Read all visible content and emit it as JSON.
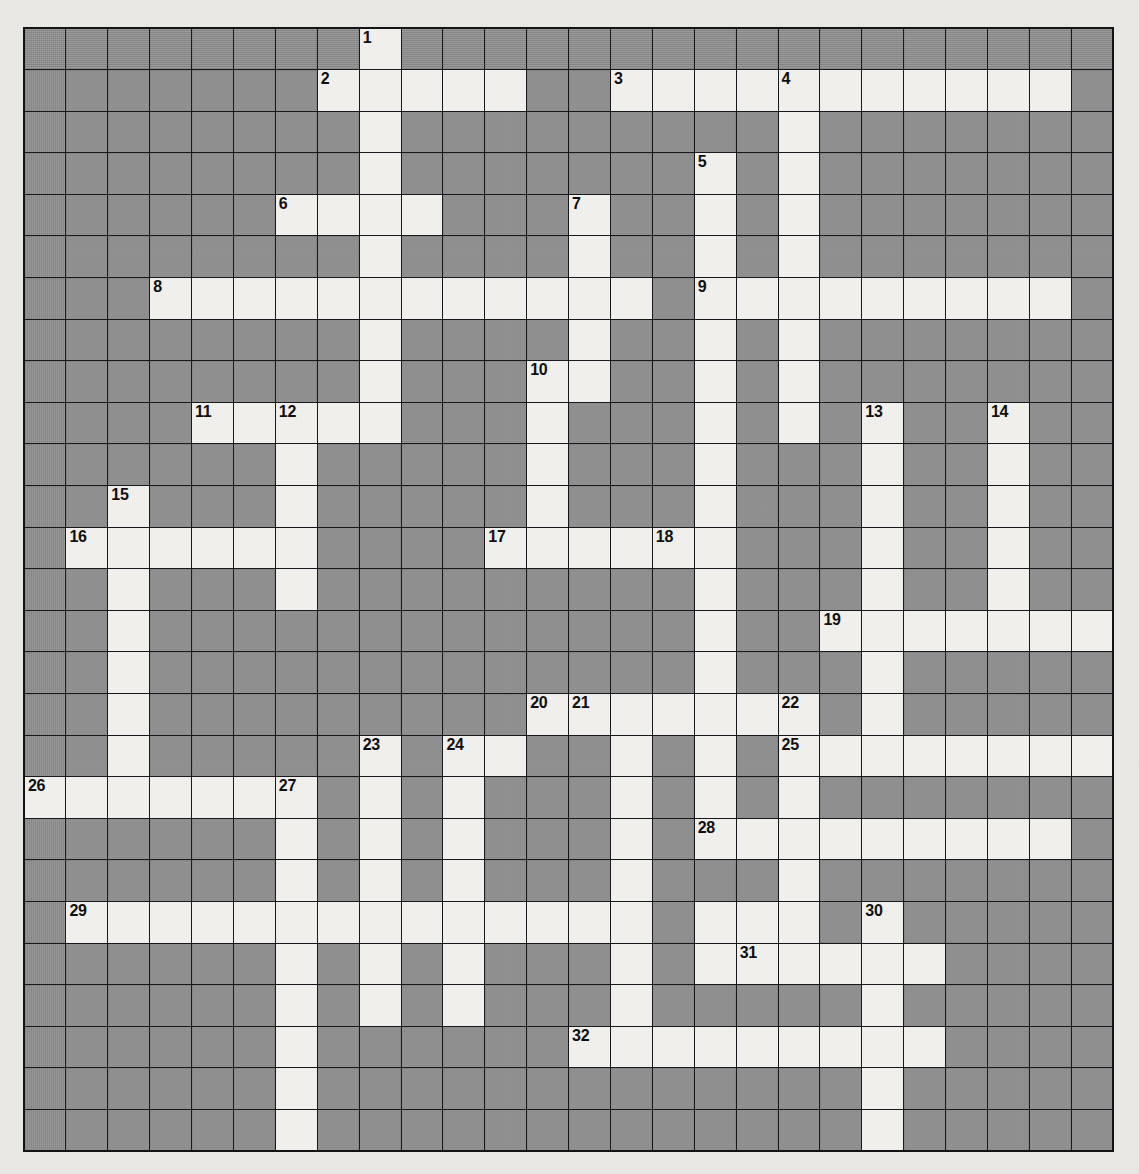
{
  "puzzle": {
    "title": "Crossword Grid",
    "columns": 26,
    "rows": 27,
    "colors": {
      "block": "#989898",
      "open": "#f4f3ef",
      "grid_line": "#15161a",
      "page_background": "#eceae6",
      "number_text": "#0d0d0f"
    },
    "highest_clue_number": 32,
    "clue_numbers_visible": [
      1,
      2,
      3,
      4,
      5,
      6,
      7,
      8,
      9,
      10,
      11,
      12,
      13,
      14,
      15,
      16,
      17,
      18,
      19,
      20,
      21,
      22,
      23,
      24,
      25,
      26,
      27,
      28,
      29,
      30,
      31,
      32
    ],
    "cells": [
      {
        "r": 0,
        "c": 8,
        "n": 1
      },
      {
        "r": 1,
        "c": 7,
        "n": 2
      },
      {
        "r": 1,
        "c": 8
      },
      {
        "r": 1,
        "c": 9
      },
      {
        "r": 1,
        "c": 10
      },
      {
        "r": 1,
        "c": 11
      },
      {
        "r": 1,
        "c": 14,
        "n": 3
      },
      {
        "r": 1,
        "c": 15
      },
      {
        "r": 1,
        "c": 16
      },
      {
        "r": 1,
        "c": 17
      },
      {
        "r": 1,
        "c": 18,
        "n": 4
      },
      {
        "r": 1,
        "c": 19
      },
      {
        "r": 1,
        "c": 20
      },
      {
        "r": 1,
        "c": 21
      },
      {
        "r": 1,
        "c": 22
      },
      {
        "r": 1,
        "c": 23
      },
      {
        "r": 1,
        "c": 24
      },
      {
        "r": 2,
        "c": 8
      },
      {
        "r": 2,
        "c": 18
      },
      {
        "r": 3,
        "c": 8
      },
      {
        "r": 3,
        "c": 16,
        "n": 5
      },
      {
        "r": 3,
        "c": 18
      },
      {
        "r": 4,
        "c": 6,
        "n": 6
      },
      {
        "r": 4,
        "c": 7
      },
      {
        "r": 4,
        "c": 8
      },
      {
        "r": 4,
        "c": 9
      },
      {
        "r": 4,
        "c": 13,
        "n": 7
      },
      {
        "r": 4,
        "c": 16
      },
      {
        "r": 4,
        "c": 18
      },
      {
        "r": 5,
        "c": 8
      },
      {
        "r": 5,
        "c": 13
      },
      {
        "r": 5,
        "c": 16
      },
      {
        "r": 5,
        "c": 18
      },
      {
        "r": 6,
        "c": 3,
        "n": 8
      },
      {
        "r": 6,
        "c": 4
      },
      {
        "r": 6,
        "c": 5
      },
      {
        "r": 6,
        "c": 6
      },
      {
        "r": 6,
        "c": 7
      },
      {
        "r": 6,
        "c": 8
      },
      {
        "r": 6,
        "c": 9
      },
      {
        "r": 6,
        "c": 10
      },
      {
        "r": 6,
        "c": 11
      },
      {
        "r": 6,
        "c": 12
      },
      {
        "r": 6,
        "c": 13
      },
      {
        "r": 6,
        "c": 14
      },
      {
        "r": 6,
        "c": 16,
        "n": 9
      },
      {
        "r": 6,
        "c": 17
      },
      {
        "r": 6,
        "c": 18
      },
      {
        "r": 6,
        "c": 19
      },
      {
        "r": 6,
        "c": 20
      },
      {
        "r": 6,
        "c": 21
      },
      {
        "r": 6,
        "c": 22
      },
      {
        "r": 6,
        "c": 23
      },
      {
        "r": 6,
        "c": 24
      },
      {
        "r": 7,
        "c": 8
      },
      {
        "r": 7,
        "c": 13
      },
      {
        "r": 7,
        "c": 16
      },
      {
        "r": 7,
        "c": 18
      },
      {
        "r": 8,
        "c": 8
      },
      {
        "r": 8,
        "c": 12,
        "n": 10
      },
      {
        "r": 8,
        "c": 13
      },
      {
        "r": 8,
        "c": 16
      },
      {
        "r": 8,
        "c": 18
      },
      {
        "r": 9,
        "c": 4,
        "n": 11
      },
      {
        "r": 9,
        "c": 5
      },
      {
        "r": 9,
        "c": 6,
        "n": 12
      },
      {
        "r": 9,
        "c": 7
      },
      {
        "r": 9,
        "c": 8
      },
      {
        "r": 9,
        "c": 12
      },
      {
        "r": 9,
        "c": 16
      },
      {
        "r": 9,
        "c": 18
      },
      {
        "r": 9,
        "c": 20,
        "n": 13
      },
      {
        "r": 9,
        "c": 23,
        "n": 14
      },
      {
        "r": 10,
        "c": 6
      },
      {
        "r": 10,
        "c": 12
      },
      {
        "r": 10,
        "c": 16
      },
      {
        "r": 10,
        "c": 20
      },
      {
        "r": 10,
        "c": 23
      },
      {
        "r": 11,
        "c": 2,
        "n": 15
      },
      {
        "r": 11,
        "c": 6
      },
      {
        "r": 11,
        "c": 12
      },
      {
        "r": 11,
        "c": 16
      },
      {
        "r": 11,
        "c": 20
      },
      {
        "r": 11,
        "c": 23
      },
      {
        "r": 12,
        "c": 1,
        "n": 16
      },
      {
        "r": 12,
        "c": 2
      },
      {
        "r": 12,
        "c": 3
      },
      {
        "r": 12,
        "c": 4
      },
      {
        "r": 12,
        "c": 5
      },
      {
        "r": 12,
        "c": 6
      },
      {
        "r": 12,
        "c": 11,
        "n": 17
      },
      {
        "r": 12,
        "c": 12
      },
      {
        "r": 12,
        "c": 13
      },
      {
        "r": 12,
        "c": 14
      },
      {
        "r": 12,
        "c": 15,
        "n": 18
      },
      {
        "r": 12,
        "c": 16
      },
      {
        "r": 12,
        "c": 20
      },
      {
        "r": 12,
        "c": 23
      },
      {
        "r": 13,
        "c": 2
      },
      {
        "r": 13,
        "c": 6
      },
      {
        "r": 13,
        "c": 16
      },
      {
        "r": 13,
        "c": 20
      },
      {
        "r": 13,
        "c": 23
      },
      {
        "r": 14,
        "c": 2
      },
      {
        "r": 14,
        "c": 16
      },
      {
        "r": 14,
        "c": 19,
        "n": 19
      },
      {
        "r": 14,
        "c": 20
      },
      {
        "r": 14,
        "c": 21
      },
      {
        "r": 14,
        "c": 22
      },
      {
        "r": 14,
        "c": 23
      },
      {
        "r": 14,
        "c": 24
      },
      {
        "r": 14,
        "c": 25
      },
      {
        "r": 15,
        "c": 2
      },
      {
        "r": 15,
        "c": 16
      },
      {
        "r": 15,
        "c": 20
      },
      {
        "r": 16,
        "c": 2
      },
      {
        "r": 16,
        "c": 12,
        "n": 20
      },
      {
        "r": 16,
        "c": 13,
        "n": 21
      },
      {
        "r": 16,
        "c": 14
      },
      {
        "r": 16,
        "c": 15
      },
      {
        "r": 16,
        "c": 16
      },
      {
        "r": 16,
        "c": 17
      },
      {
        "r": 16,
        "c": 18,
        "n": 22
      },
      {
        "r": 16,
        "c": 20
      },
      {
        "r": 17,
        "c": 2
      },
      {
        "r": 17,
        "c": 8,
        "n": 23
      },
      {
        "r": 17,
        "c": 10,
        "n": 24
      },
      {
        "r": 17,
        "c": 11
      },
      {
        "r": 17,
        "c": 14
      },
      {
        "r": 17,
        "c": 16
      },
      {
        "r": 17,
        "c": 18,
        "n": 25
      },
      {
        "r": 17,
        "c": 19
      },
      {
        "r": 17,
        "c": 20
      },
      {
        "r": 17,
        "c": 21
      },
      {
        "r": 17,
        "c": 22
      },
      {
        "r": 17,
        "c": 23
      },
      {
        "r": 17,
        "c": 24
      },
      {
        "r": 17,
        "c": 25
      },
      {
        "r": 18,
        "c": 0,
        "n": 26
      },
      {
        "r": 18,
        "c": 1
      },
      {
        "r": 18,
        "c": 2
      },
      {
        "r": 18,
        "c": 3
      },
      {
        "r": 18,
        "c": 4
      },
      {
        "r": 18,
        "c": 5
      },
      {
        "r": 18,
        "c": 6,
        "n": 27
      },
      {
        "r": 18,
        "c": 8
      },
      {
        "r": 18,
        "c": 10
      },
      {
        "r": 18,
        "c": 14
      },
      {
        "r": 18,
        "c": 16
      },
      {
        "r": 18,
        "c": 18
      },
      {
        "r": 19,
        "c": 6
      },
      {
        "r": 19,
        "c": 8
      },
      {
        "r": 19,
        "c": 10
      },
      {
        "r": 19,
        "c": 14
      },
      {
        "r": 19,
        "c": 16,
        "n": 28
      },
      {
        "r": 19,
        "c": 17
      },
      {
        "r": 19,
        "c": 18
      },
      {
        "r": 19,
        "c": 19
      },
      {
        "r": 19,
        "c": 20
      },
      {
        "r": 19,
        "c": 21
      },
      {
        "r": 19,
        "c": 22
      },
      {
        "r": 19,
        "c": 23
      },
      {
        "r": 19,
        "c": 24
      },
      {
        "r": 20,
        "c": 6
      },
      {
        "r": 20,
        "c": 8
      },
      {
        "r": 20,
        "c": 10
      },
      {
        "r": 20,
        "c": 14
      },
      {
        "r": 20,
        "c": 18
      },
      {
        "r": 21,
        "c": 1,
        "n": 29
      },
      {
        "r": 21,
        "c": 2
      },
      {
        "r": 21,
        "c": 3
      },
      {
        "r": 21,
        "c": 4
      },
      {
        "r": 21,
        "c": 5
      },
      {
        "r": 21,
        "c": 6
      },
      {
        "r": 21,
        "c": 7
      },
      {
        "r": 21,
        "c": 8
      },
      {
        "r": 21,
        "c": 9
      },
      {
        "r": 21,
        "c": 10
      },
      {
        "r": 21,
        "c": 11
      },
      {
        "r": 21,
        "c": 12
      },
      {
        "r": 21,
        "c": 13
      },
      {
        "r": 21,
        "c": 14
      },
      {
        "r": 21,
        "c": 16
      },
      {
        "r": 21,
        "c": 17
      },
      {
        "r": 21,
        "c": 18
      },
      {
        "r": 21,
        "c": 20,
        "n": 30
      },
      {
        "r": 22,
        "c": 6
      },
      {
        "r": 22,
        "c": 8
      },
      {
        "r": 22,
        "c": 10
      },
      {
        "r": 22,
        "c": 14
      },
      {
        "r": 22,
        "c": 16
      },
      {
        "r": 22,
        "c": 17,
        "n": 31
      },
      {
        "r": 22,
        "c": 18
      },
      {
        "r": 22,
        "c": 19
      },
      {
        "r": 22,
        "c": 20
      },
      {
        "r": 22,
        "c": 21
      },
      {
        "r": 23,
        "c": 6
      },
      {
        "r": 23,
        "c": 8
      },
      {
        "r": 23,
        "c": 10
      },
      {
        "r": 23,
        "c": 14
      },
      {
        "r": 23,
        "c": 20
      },
      {
        "r": 24,
        "c": 6
      },
      {
        "r": 24,
        "c": 13,
        "n": 32
      },
      {
        "r": 24,
        "c": 14
      },
      {
        "r": 24,
        "c": 15
      },
      {
        "r": 24,
        "c": 16
      },
      {
        "r": 24,
        "c": 17
      },
      {
        "r": 24,
        "c": 18
      },
      {
        "r": 24,
        "c": 19
      },
      {
        "r": 24,
        "c": 20
      },
      {
        "r": 24,
        "c": 21
      },
      {
        "r": 25,
        "c": 6
      },
      {
        "r": 25,
        "c": 20
      },
      {
        "r": 26,
        "c": 6
      },
      {
        "r": 26,
        "c": 20
      }
    ]
  }
}
